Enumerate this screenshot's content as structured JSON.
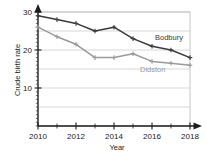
{
  "chart_data": {
    "type": "line",
    "title": "",
    "xlabel": "Year",
    "ylabel": "Crude birth rate",
    "x": [
      2010,
      2011,
      2012,
      2013,
      2014,
      2015,
      2016,
      2017,
      2018
    ],
    "xlim": [
      2010,
      2018
    ],
    "ylim": [
      0,
      30
    ],
    "xticks": [
      2010,
      2012,
      2014,
      2016,
      2018
    ],
    "xtick_labels": [
      "2010",
      "2012",
      "2014",
      "2016",
      "2018"
    ],
    "xminor_ticks": [
      2011,
      2013,
      2015,
      2017
    ],
    "yticks": [
      10,
      20,
      30
    ],
    "ytick_labels": [
      "10",
      "20",
      "30"
    ],
    "gridlines": [
      5,
      10,
      15,
      20,
      25,
      30
    ],
    "grid": true,
    "legend_position": "inline-annotations",
    "series": [
      {
        "name": "Bodbury",
        "color": "#3a3a3a",
        "marker": "cross",
        "values": [
          29,
          28,
          27,
          25,
          26,
          23,
          21,
          20,
          18
        ]
      },
      {
        "name": "Didston",
        "color": "#9a9a9a",
        "marker": "cross",
        "values": [
          26,
          23.5,
          21.5,
          18,
          18,
          19,
          17,
          16.5,
          16
        ]
      }
    ],
    "annotations": [
      {
        "text": "Bodbury",
        "series": "Bodbury",
        "color": "#3a3a3a"
      },
      {
        "text": "Didston",
        "series": "Didston",
        "color": "#9a9a9a"
      }
    ]
  },
  "axes": {
    "x_arrow": true,
    "y_arrow": true,
    "plot_border": true
  }
}
